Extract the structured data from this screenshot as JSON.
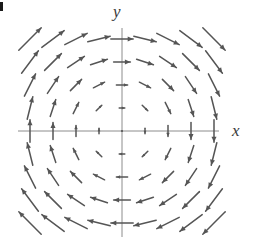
{
  "figure": {
    "width": 253,
    "height": 241,
    "background": "#ffffff",
    "corner_mark": "edge-artifact"
  },
  "axes": {
    "color": "#8c8c8c",
    "stroke_width": 1,
    "x_axis": {
      "x_start": 18,
      "x_end": 219,
      "y": 131
    },
    "y_axis": {
      "y_start": 28,
      "y_end": 237,
      "x": 122
    },
    "x_label": "x",
    "y_label": "y",
    "label_color": "#3a3a3a"
  },
  "chart_data": {
    "type": "quiver",
    "title": "",
    "xlabel": "x",
    "ylabel": "y",
    "grid": false,
    "legend": false,
    "xlim": [
      -4.5,
      4.5
    ],
    "ylim": [
      -4.5,
      4.5
    ],
    "origin_px": [
      122,
      131
    ],
    "spacing_px": 23,
    "arrow_color": "#555555",
    "arrow_scale_px_per_unit": 5.6,
    "field_formula": "(u, v) = (y, -x)",
    "rotation": "clockwise",
    "grid_x": [
      -4,
      -3,
      -2,
      -1,
      0,
      1,
      2,
      3,
      4
    ],
    "grid_y": [
      -4,
      -3,
      -2,
      -1,
      0,
      1,
      2,
      3,
      4
    ],
    "samples": [
      {
        "x": -4,
        "y": 4,
        "u": 4,
        "v": 4
      },
      {
        "x": 0,
        "y": 4,
        "u": 4,
        "v": 0
      },
      {
        "x": 4,
        "y": 4,
        "u": 4,
        "v": -4
      },
      {
        "x": -4,
        "y": 0,
        "u": 0,
        "v": 4
      },
      {
        "x": 0,
        "y": 0,
        "u": 0,
        "v": 0
      },
      {
        "x": 4,
        "y": 0,
        "u": 0,
        "v": -4
      },
      {
        "x": -4,
        "y": -4,
        "u": -4,
        "v": 4
      },
      {
        "x": 0,
        "y": -4,
        "u": -4,
        "v": 0
      },
      {
        "x": 4,
        "y": -4,
        "u": -4,
        "v": -4
      }
    ]
  }
}
